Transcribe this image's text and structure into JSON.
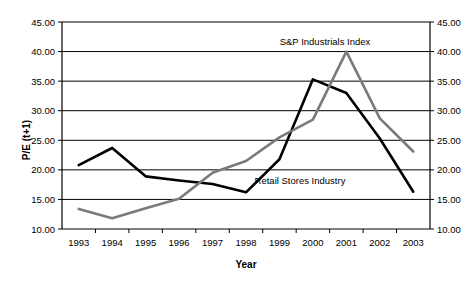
{
  "chart_data": {
    "type": "line",
    "title": "",
    "xlabel": "Year",
    "ylabel": "P/E (t+1)",
    "categories": [
      "1993",
      "1994",
      "1995",
      "1996",
      "1997",
      "1998",
      "1999",
      "2000",
      "2001",
      "2002",
      "2003"
    ],
    "ylim": [
      10.0,
      45.0
    ],
    "ytick_values": [
      10.0,
      15.0,
      20.0,
      25.0,
      30.0,
      35.0,
      40.0,
      45.0
    ],
    "ytick_labels": [
      "10.00",
      "15.00",
      "20.00",
      "25.00",
      "30.00",
      "35.00",
      "40.00",
      "45.00"
    ],
    "ytick_labels_right": [
      "10.00",
      "15.00",
      "20.00",
      "25.00",
      "30.00",
      "35.00",
      "40.00",
      "45.00"
    ],
    "grid": "horizontal",
    "legend_position": "inline-annotations",
    "series": [
      {
        "name": "Retail Stores Industry",
        "color": "#000000",
        "width": 2.6,
        "values": [
          20.8,
          23.7,
          18.9,
          18.2,
          17.6,
          16.2,
          21.8,
          35.3,
          33.0,
          25.3,
          16.3
        ],
        "annotation": {
          "label": "Retail Stores Industry",
          "x_px": 300,
          "y_px": 184
        }
      },
      {
        "name": "S&P Industrials Index",
        "color": "#7a7a7a",
        "width": 2.6,
        "values": [
          13.4,
          11.8,
          13.5,
          15.1,
          19.5,
          21.5,
          25.5,
          28.5,
          40.0,
          28.7,
          23.1
        ],
        "annotation": {
          "label": "S&P Industrials Index",
          "x_px": 325,
          "y_px": 45
        }
      }
    ]
  },
  "axes": {
    "y_title": "P/E (t+1)",
    "x_title": "Year"
  }
}
